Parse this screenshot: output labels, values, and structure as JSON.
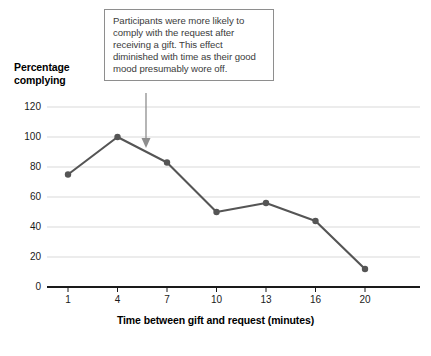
{
  "chart_data": {
    "type": "line",
    "title": "",
    "xlabel": "Time between gift and request (minutes)",
    "ylabel": "Percentage complying",
    "x": [
      1,
      4,
      7,
      10,
      13,
      16,
      20
    ],
    "categories": [
      "1",
      "4",
      "7",
      "10",
      "13",
      "16",
      "20"
    ],
    "values": [
      75,
      100,
      83,
      50,
      56,
      44,
      12
    ],
    "series": [
      {
        "name": "Percentage complying",
        "values": [
          75,
          100,
          83,
          50,
          56,
          44,
          12
        ]
      }
    ],
    "xtick_labels": [
      "1",
      "4",
      "7",
      "10",
      "13",
      "16",
      "20"
    ],
    "ytick_labels": [
      "0",
      "20",
      "40",
      "60",
      "80",
      "100",
      "120"
    ],
    "yticks": [
      0,
      20,
      40,
      60,
      80,
      100,
      120
    ],
    "ylim": [
      0,
      120
    ],
    "grid": "horizontal",
    "legend": "none",
    "line_color": "#555555",
    "marker": "circle",
    "marker_color": "#555555",
    "grid_color": "#d9d9d9",
    "axis_color": "#1a1a1a",
    "annotations": [
      {
        "text": "Participants were more likely to comply with the request after receiving a gift. This effect diminished with time as their good mood presumably wore off.",
        "arrow": "down",
        "points_to_x": 5.5,
        "points_to_y": 92
      }
    ]
  },
  "axis": {
    "y_title_line1": "Percentage",
    "y_title_line2": "complying",
    "x_title": "Time between gift and request (minutes)"
  },
  "annotation": {
    "text": "Participants were more likely to comply with the request after receiving a gift. This effect diminished with time as their good mood presumably wore off."
  }
}
